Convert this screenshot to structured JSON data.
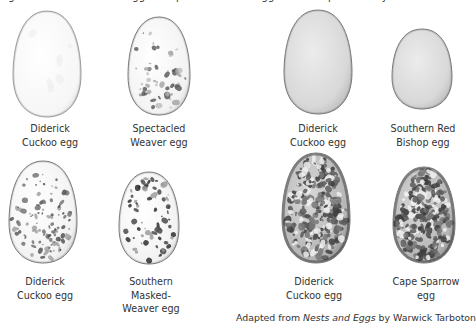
{
  "top_text": "Figure: Diderick Cuckoo eggs compared with the eggs of host species they mimic",
  "panels": [
    {
      "eggs": [
        {
          "id": "diderick-plain",
          "label_lines": [
            "Diderick",
            "Cuckoo egg"
          ],
          "pattern": "plain-white"
        },
        {
          "id": "spectacled-weaver",
          "label_lines": [
            "Spectacled",
            "Weaver egg"
          ],
          "pattern": "light-speckled"
        }
      ]
    },
    {
      "eggs": [
        {
          "id": "diderick-pale",
          "label_lines": [
            "Diderick",
            "Cuckoo egg"
          ],
          "pattern": "plain-grey"
        },
        {
          "id": "southern-red-bishop",
          "label_lines": [
            "Southern Red",
            "Bishop egg"
          ],
          "pattern": "plain-grey"
        }
      ]
    },
    {
      "eggs": [
        {
          "id": "diderick-speckled",
          "label_lines": [
            "Diderick",
            "Cuckoo egg"
          ],
          "pattern": "speckled"
        },
        {
          "id": "southern-masked-weaver",
          "label_lines": [
            "Southern",
            "Masked-",
            "Weaver egg"
          ],
          "pattern": "dark-spotted"
        }
      ]
    },
    {
      "eggs": [
        {
          "id": "diderick-mottled",
          "label_lines": [
            "Diderick",
            "Cuckoo egg"
          ],
          "pattern": "heavily-mottled"
        },
        {
          "id": "cape-sparrow",
          "label_lines": [
            "Cape Sparrow",
            "egg"
          ],
          "pattern": "heavily-mottled"
        }
      ]
    }
  ],
  "caption": {
    "prefix": "Adapted from ",
    "title": "Nests and Eggs",
    "suffix": " by Warwick Tarboton"
  },
  "colors": {
    "egg_outline": "#7a7a7a",
    "plain_white_fill": "#fbfbfb",
    "plain_grey_fill": "#dcdcdc",
    "speckle_dark": "#4a4a4a",
    "speckle_light": "#9c9c9c",
    "mottle_dark": "#3e3e3e"
  }
}
